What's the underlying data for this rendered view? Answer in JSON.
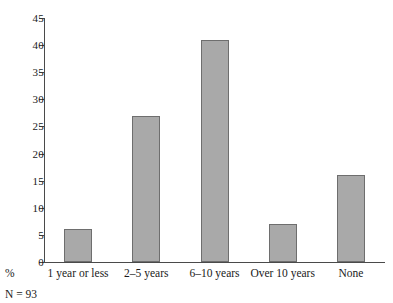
{
  "chart_data": {
    "type": "bar",
    "title": "",
    "subtitle": "",
    "xlabel": "",
    "ylabel": "",
    "categories": [
      "1 year or less",
      "2–5 years",
      "6–10 years",
      "Over 10 years",
      "None"
    ],
    "values": [
      6,
      27,
      41,
      7,
      16
    ],
    "ylim": [
      0,
      45
    ],
    "ytick_values": [
      0,
      5,
      10,
      15,
      20,
      25,
      30,
      35,
      40,
      45
    ],
    "ytick_labels": [
      "0",
      "5",
      "10",
      "15",
      "20",
      "25",
      "30",
      "35",
      "40",
      "45"
    ],
    "grid": false,
    "legend": null,
    "annotations": {
      "axis_prefix": "%",
      "sample_note": "N = 93"
    },
    "colors": {
      "bar_fill": "#a9a9a9",
      "bar_stroke": "#6e6e6e",
      "axis": "#4a4a4a",
      "text": "#1a1a1a",
      "background": "#ffffff"
    }
  }
}
